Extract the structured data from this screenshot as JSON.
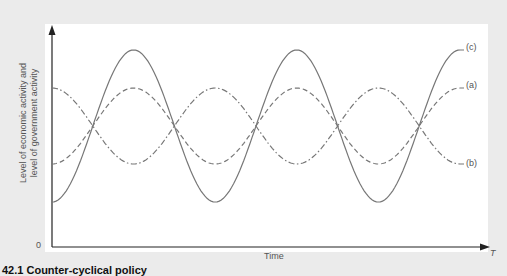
{
  "chart_data": {
    "type": "line",
    "title": "Counter-cyclical policy",
    "figure_number": "42.1",
    "xlabel": "Time",
    "ylabel": "Level of economic activity and level of government activity",
    "x_axis_end_label": "T",
    "y_origin_label": "0",
    "grid": false,
    "legend_position": "right-end labels",
    "x": [
      0,
      0.5,
      1,
      1.5,
      2,
      2.5,
      3,
      3.5,
      4,
      4.5,
      5
    ],
    "series": [
      {
        "name": "(a)",
        "style": "dashed",
        "values": [
          -1,
          0,
          1,
          0,
          -1,
          0,
          1,
          0,
          -1,
          0,
          1
        ],
        "amplitude": 0.5
      },
      {
        "name": "(b)",
        "style": "dash-dot",
        "values": [
          1,
          0,
          -1,
          0,
          1,
          0,
          -1,
          0,
          1,
          0,
          -1
        ],
        "amplitude": 0.5
      },
      {
        "name": "(c)",
        "style": "solid",
        "values": [
          -1,
          0,
          1,
          0,
          -1,
          0,
          1,
          0,
          -1,
          0,
          1
        ],
        "amplitude": 1
      }
    ]
  },
  "labels": {
    "ylabel_line1": "Level of economic activity and",
    "ylabel_line2": "level of government activity",
    "zero": "0",
    "xlabel": "Time",
    "t": "T",
    "a": "(a)",
    "b": "(b)",
    "c": "(c)",
    "caption": "42.1 Counter-cyclical policy"
  },
  "colors": {
    "curve": "#777777",
    "axis": "#222222",
    "background": "#ebebeb",
    "panel": "#ffffff"
  }
}
